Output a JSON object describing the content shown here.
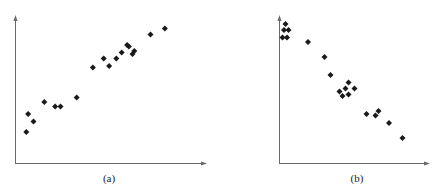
{
  "figure": {
    "panels": [
      {
        "id": "a",
        "caption": "(a)"
      },
      {
        "id": "b",
        "caption": "(b)"
      }
    ],
    "colors": {
      "axis": "#6a6a6a",
      "marker": "#1a1a1a",
      "background": "#ffffff"
    }
  },
  "chart_data": [
    {
      "type": "scatter",
      "title": "(a)",
      "xlabel": "",
      "ylabel": "",
      "grid": false,
      "legend": null,
      "marker": "diamond",
      "note": "Unlabeled axes; positive correlation. Values in relative units (0-100) estimated from pixel positions.",
      "points": [
        {
          "x": 6,
          "y": 21
        },
        {
          "x": 7,
          "y": 33
        },
        {
          "x": 10,
          "y": 28
        },
        {
          "x": 16,
          "y": 41
        },
        {
          "x": 22,
          "y": 38
        },
        {
          "x": 25,
          "y": 38
        },
        {
          "x": 34,
          "y": 44
        },
        {
          "x": 43,
          "y": 64
        },
        {
          "x": 49,
          "y": 70
        },
        {
          "x": 52,
          "y": 65
        },
        {
          "x": 56,
          "y": 70
        },
        {
          "x": 59,
          "y": 74
        },
        {
          "x": 62,
          "y": 79
        },
        {
          "x": 63,
          "y": 78
        },
        {
          "x": 65,
          "y": 73
        },
        {
          "x": 66,
          "y": 75
        },
        {
          "x": 75,
          "y": 86
        },
        {
          "x": 83,
          "y": 90
        }
      ],
      "xlim": [
        0,
        100
      ],
      "ylim": [
        0,
        100
      ]
    },
    {
      "type": "scatter",
      "title": "(b)",
      "xlabel": "",
      "ylabel": "",
      "grid": false,
      "legend": null,
      "marker": "diamond",
      "note": "Unlabeled axes; negative correlation. Values in relative units (0-100) estimated from pixel positions.",
      "points": [
        {
          "x": 4,
          "y": 93
        },
        {
          "x": 3,
          "y": 89
        },
        {
          "x": 6,
          "y": 89
        },
        {
          "x": 2,
          "y": 84
        },
        {
          "x": 5,
          "y": 84
        },
        {
          "x": 19,
          "y": 81
        },
        {
          "x": 30,
          "y": 71
        },
        {
          "x": 34,
          "y": 59
        },
        {
          "x": 46,
          "y": 54
        },
        {
          "x": 44,
          "y": 50
        },
        {
          "x": 40,
          "y": 48
        },
        {
          "x": 42,
          "y": 45
        },
        {
          "x": 46,
          "y": 46
        },
        {
          "x": 50,
          "y": 50
        },
        {
          "x": 58,
          "y": 33
        },
        {
          "x": 64,
          "y": 32
        },
        {
          "x": 66,
          "y": 35
        },
        {
          "x": 73,
          "y": 27
        },
        {
          "x": 82,
          "y": 17
        }
      ],
      "xlim": [
        0,
        100
      ],
      "ylim": [
        0,
        100
      ]
    }
  ]
}
